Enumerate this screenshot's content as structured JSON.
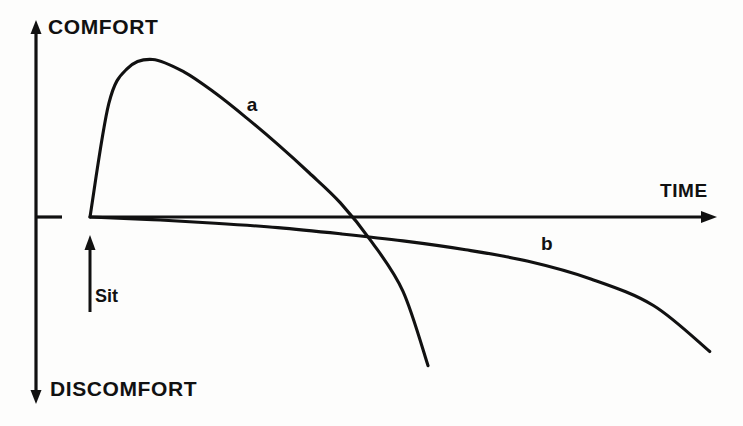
{
  "figure": {
    "name": "comfort-discomfort-over-time-graph",
    "background_color": "#fdfdfc",
    "ink_color": "#111111"
  },
  "axes": {
    "vertical": {
      "top_label": "COMFORT",
      "bottom_label": "DISCOMFORT",
      "origin_tick": true
    },
    "horizontal": {
      "label": "TIME"
    }
  },
  "annotations": {
    "sit_marker": "Sit",
    "curve_a_label": "a",
    "curve_b_label": "b"
  },
  "chart_data": {
    "type": "line",
    "title": "",
    "subtitle": "",
    "xlabel": "TIME",
    "ylabel": "COMFORT / DISCOMFORT",
    "xlim": [
      0,
      10
    ],
    "ylim": [
      -10,
      10
    ],
    "grid": false,
    "legend": "inline-curve-labels",
    "axis_style": "arrow-headed qualitative axes, no numeric ticks",
    "annotations": [
      {
        "text": "Sit",
        "x": 0,
        "y": -3.2,
        "note": "upward arrow at time zero marking the moment of sitting down"
      }
    ],
    "series": [
      {
        "name": "a",
        "label": "a",
        "label_x": 2.6,
        "label_y": 6.3,
        "description": "Seat a: comfort rises steeply to a high peak shortly after sitting, then falls rapidly, crossing into discomfort early and continuing steeply downward.",
        "x": [
          0.0,
          0.3,
          0.6,
          1.0,
          1.5,
          2.0,
          2.5,
          3.0,
          3.5,
          4.0,
          4.5,
          5.0,
          5.4
        ],
        "y": [
          0.0,
          6.4,
          8.4,
          8.9,
          8.2,
          7.0,
          5.6,
          4.1,
          2.5,
          0.8,
          -1.4,
          -4.2,
          -8.4
        ]
      },
      {
        "name": "b",
        "label": "b",
        "label_x": 7.3,
        "label_y": -1.6,
        "description": "Seat b: essentially no initial comfort peak; stays near neutral for a long period then drifts slowly and increasingly into discomfort.",
        "x": [
          0.0,
          1.0,
          2.0,
          3.0,
          4.0,
          5.0,
          6.0,
          7.0,
          8.0,
          9.0,
          9.9
        ],
        "y": [
          0.0,
          -0.15,
          -0.35,
          -0.6,
          -0.95,
          -1.35,
          -1.85,
          -2.5,
          -3.5,
          -5.0,
          -7.6
        ]
      }
    ]
  }
}
